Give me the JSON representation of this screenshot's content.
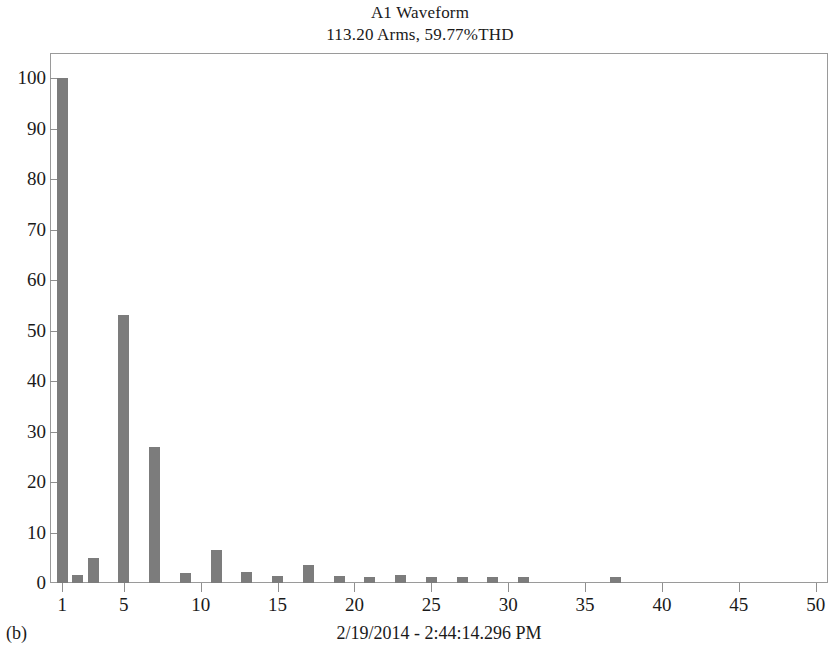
{
  "chart_data": {
    "type": "bar",
    "title": "A1 Waveform",
    "subtitle": "113.20 Arms, 59.77%THD",
    "xlabel": "",
    "ylabel": "",
    "xlim": [
      0.2,
      50.8
    ],
    "ylim": [
      0,
      105
    ],
    "grid": false,
    "legend": null,
    "bar_color": "#7c7c7c",
    "axis_color": "#8f8f8f",
    "x_ticks": [
      1,
      5,
      10,
      15,
      20,
      25,
      30,
      35,
      40,
      45,
      50
    ],
    "x_tick_labels": [
      "1",
      "5",
      "10",
      "15",
      "20",
      "25",
      "30",
      "35",
      "40",
      "45",
      "50"
    ],
    "y_ticks": [
      0,
      10,
      20,
      30,
      40,
      50,
      60,
      70,
      80,
      90,
      100
    ],
    "y_tick_labels": [
      "0",
      "10",
      "20",
      "30",
      "40",
      "50",
      "60",
      "70",
      "80",
      "90",
      "100"
    ],
    "categories": [
      1,
      2,
      3,
      5,
      7,
      9,
      11,
      13,
      15,
      17,
      19,
      21,
      23,
      25,
      27,
      29,
      31,
      37
    ],
    "values": [
      100,
      1.5,
      5,
      53,
      27,
      2,
      6.5,
      2.2,
      1.4,
      3.5,
      1.3,
      1.2,
      1.5,
      1.1,
      1.2,
      1.1,
      1.2,
      1.2
    ],
    "annotations": {
      "figure_caption": "(b)",
      "timestamp": "2/19/2014 - 2:44:14.296 PM"
    }
  },
  "figure": {
    "caption": "(b)",
    "timestamp": "2/19/2014 - 2:44:14.296 PM"
  }
}
